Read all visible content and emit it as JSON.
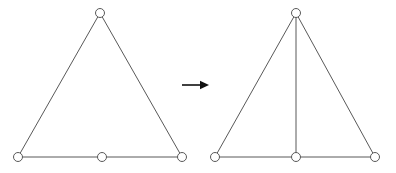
{
  "figure": {
    "background_color": "#ffffff",
    "width": 396,
    "height": 173,
    "edge_color": "#595959",
    "node_fill_color": "#ffffff",
    "node_stroke_color": "#595959",
    "arrow_color": "#111111",
    "node_radius": 4.5,
    "edge_stroke_width": 1
  },
  "chart_data": {
    "type": "diagram",
    "title": "",
    "subtitle": "",
    "graphs": [
      {
        "name": "before-graph",
        "label": "",
        "nodes": [
          {
            "id": "apex",
            "x": 100,
            "y": 13
          },
          {
            "id": "base-left",
            "x": 18,
            "y": 157
          },
          {
            "id": "base-mid",
            "x": 102,
            "y": 157
          },
          {
            "id": "base-right",
            "x": 182,
            "y": 157
          }
        ],
        "edges": [
          {
            "id": "left-side",
            "from": "apex",
            "to": "base-left"
          },
          {
            "id": "right-side",
            "from": "apex",
            "to": "base-right"
          },
          {
            "id": "base-left-segment",
            "from": "base-left",
            "to": "base-mid"
          },
          {
            "id": "base-right-segment",
            "from": "base-mid",
            "to": "base-right"
          }
        ],
        "node_count": 4,
        "edge_count": 4
      },
      {
        "name": "after-graph",
        "label": "",
        "nodes": [
          {
            "id": "apex",
            "x": 296,
            "y": 13
          },
          {
            "id": "base-left",
            "x": 215,
            "y": 157
          },
          {
            "id": "base-mid",
            "x": 296,
            "y": 157
          },
          {
            "id": "base-right",
            "x": 375,
            "y": 157
          }
        ],
        "edges": [
          {
            "id": "left-side",
            "from": "apex",
            "to": "base-left"
          },
          {
            "id": "right-side",
            "from": "apex",
            "to": "base-right"
          },
          {
            "id": "base-left-segment",
            "from": "base-left",
            "to": "base-mid"
          },
          {
            "id": "base-right-segment",
            "from": "base-mid",
            "to": "base-right"
          },
          {
            "id": "bisector",
            "from": "apex",
            "to": "base-mid"
          }
        ],
        "node_count": 4,
        "edge_count": 5
      }
    ],
    "annotations": [
      {
        "id": "transform-arrow",
        "type": "arrow",
        "direction": "right",
        "label": "",
        "x1": 182,
        "y1": 85,
        "x2": 209,
        "y2": 85
      }
    ],
    "legend": [],
    "grid": false
  }
}
